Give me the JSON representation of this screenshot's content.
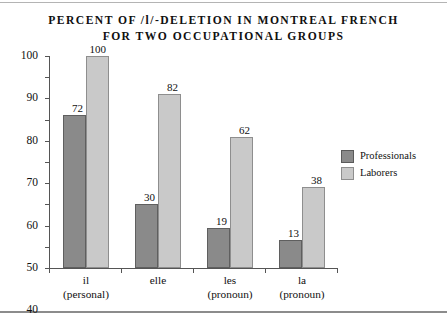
{
  "chart_data": {
    "type": "bar",
    "title": "PERCENT OF /l/-DELETION IN MONTREAL FRENCH FOR TWO OCCUPATIONAL GROUPS",
    "title_line1": "PERCENT OF /l/-DELETION IN MONTREAL FRENCH",
    "title_line2": "FOR TWO OCCUPATIONAL GROUPS",
    "xlabel": "",
    "ylabel": "",
    "ylim": [
      0,
      100
    ],
    "ytick_step": 10,
    "yticks": [
      0,
      10,
      20,
      30,
      40,
      50,
      60,
      70,
      80,
      90,
      100
    ],
    "grid": false,
    "legend_position": "right",
    "categories": [
      {
        "name": "il",
        "sub": "(personal)"
      },
      {
        "name": "elle",
        "sub": ""
      },
      {
        "name": "les",
        "sub": "(pronoun)"
      },
      {
        "name": "la",
        "sub": "(pronoun)"
      }
    ],
    "series": [
      {
        "name": "Professionals",
        "color": "#8a8a8a",
        "values": [
          72,
          30,
          19,
          13
        ]
      },
      {
        "name": "Laborers",
        "color": "#c9c9c9",
        "values": [
          100,
          82,
          62,
          38
        ]
      }
    ]
  }
}
